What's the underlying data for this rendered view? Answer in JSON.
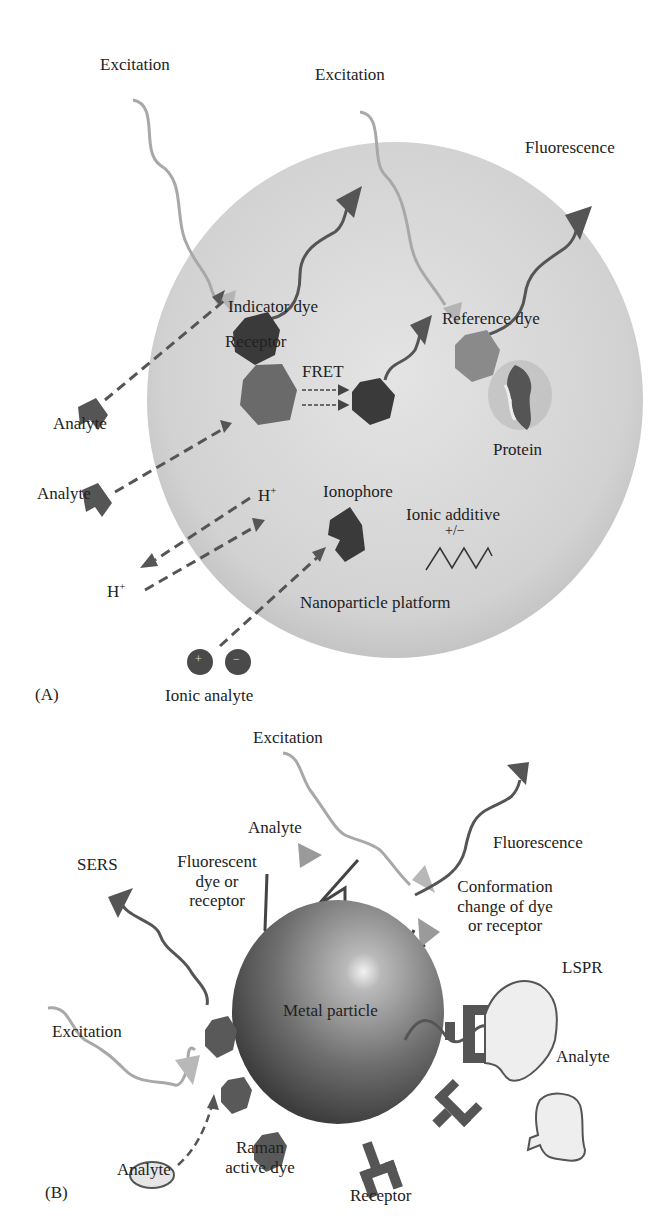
{
  "panel_a": {
    "label": "(A)",
    "excitation_1": "Excitation",
    "excitation_2": "Excitation",
    "fluorescence": "Fluorescence",
    "indicator_dye": "Indicator dye",
    "reference_dye": "Reference dye",
    "receptor": "Receptor",
    "fret": "FRET",
    "protein": "Protein",
    "analyte_1": "Analyte",
    "analyte_2": "Analyte",
    "h_plus_1": "H",
    "h_plus_2": "H",
    "plus_sup": "+",
    "ionophore": "Ionophore",
    "ionic_additive": "Ionic additive",
    "ionic_additive_sign": "+/−",
    "nanoparticle_platform": "Nanoparticle platform",
    "ionic_analyte": "Ionic analyte",
    "ion_plus": "+",
    "ion_minus": "−"
  },
  "panel_b": {
    "label": "(B)",
    "excitation_top": "Excitation",
    "excitation_left": "Excitation",
    "analyte_top": "Analyte",
    "sers": "SERS",
    "fluorescent_dye": [
      "Fluorescent",
      "dye or",
      "receptor"
    ],
    "fluorescence": "Fluorescence",
    "conformation": [
      "Conformation",
      "change of dye",
      "or receptor"
    ],
    "lspr": "LSPR",
    "metal_particle": "Metal particle",
    "analyte_right": "Analyte",
    "analyte_bottom": "Analyte",
    "raman": [
      "Raman",
      "active dye"
    ],
    "receptor": "Receptor"
  },
  "colors": {
    "sphere_fill": "#d6d6d6",
    "dark_shape": "#3a3a3a",
    "mid_shape": "#5e5e5e",
    "light_wave": "#a8a8a8",
    "text": "#222222"
  }
}
